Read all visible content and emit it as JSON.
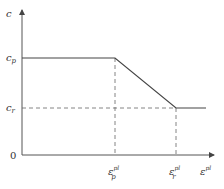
{
  "diagram": {
    "type": "piecewise-linear softening curve",
    "axes": {
      "y_label": "c",
      "x_label": "ε",
      "x_label_sup": "pl",
      "origin_label": "0"
    },
    "y_ticks": [
      {
        "base": "c",
        "sub": "p"
      },
      {
        "base": "c",
        "sub": "r"
      }
    ],
    "x_ticks": [
      {
        "base": "ε",
        "sub": "p",
        "sup": "pl"
      },
      {
        "base": "ε",
        "sub": "r",
        "sup": "pl"
      }
    ],
    "colors": {
      "line": "#444444",
      "axis": "#555555",
      "dashed": "#666666"
    }
  }
}
